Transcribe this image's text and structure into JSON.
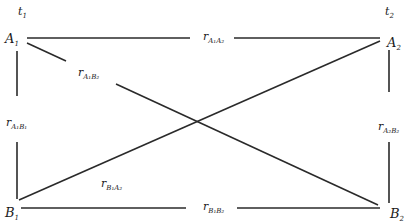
{
  "diagram": {
    "type": "cross-lagged correlation diagram",
    "time_labels": {
      "t1": {
        "base": "t",
        "sub": "1"
      },
      "t2": {
        "base": "t",
        "sub": "2"
      }
    },
    "nodes": {
      "A1": {
        "base": "A",
        "sub": "1"
      },
      "A2": {
        "base": "A",
        "sub": "2"
      },
      "B1": {
        "base": "B",
        "sub": "1"
      },
      "B2": {
        "base": "B",
        "sub": "2"
      }
    },
    "edges": {
      "A1A2": {
        "base": "r",
        "sub": "A₁A₂",
        "from": "A1",
        "to": "A2"
      },
      "B1B2": {
        "base": "r",
        "sub": "B₁B₂",
        "from": "B1",
        "to": "B2"
      },
      "A1B1": {
        "base": "r",
        "sub": "A₁B₁",
        "from": "A1",
        "to": "B1"
      },
      "A2B2": {
        "base": "r",
        "sub": "A₂B₂",
        "from": "A2",
        "to": "B2"
      },
      "A1B2": {
        "base": "r",
        "sub": "A₁B₂",
        "from": "A1",
        "to": "B2"
      },
      "B1A2": {
        "base": "r",
        "sub": "B₁A₂",
        "from": "B1",
        "to": "A2"
      }
    },
    "line_color": "#2a2a2a"
  }
}
